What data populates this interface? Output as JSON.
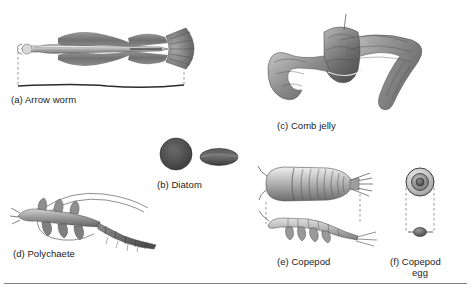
{
  "figure": {
    "background_color": "#ffffff",
    "ink_color": "#1b1b1b",
    "rule_color": "#7e7e7e",
    "dashed_guide_color": "#8d8d8d"
  },
  "specimens": [
    {
      "key": "arrow-worm",
      "letter": "(a)",
      "name": "Arrow worm",
      "caption": "(a) Arrow worm",
      "view": "lateral whole body",
      "has_scale_bracket": true,
      "shading": "grayscale stipple engraving"
    },
    {
      "key": "diatom",
      "letter": "(b)",
      "name": "Diatom",
      "caption": "(b) Diatom",
      "view": "valve face view and girdle side view",
      "has_scale_bracket": false,
      "shading": "dark gray stipple",
      "fill_color": "#4a4a4a"
    },
    {
      "key": "comb-jelly",
      "letter": "(c)",
      "name": "Comb jelly",
      "caption": "(c) Comb jelly",
      "view": "ribbon form, undulating",
      "has_scale_bracket": false,
      "shading": "gray gradient engraving"
    },
    {
      "key": "polychaete",
      "letter": "(d)",
      "name": "Polychaete",
      "caption": "(d) Polychaete",
      "view": "lateral, segmented with bristles",
      "has_scale_bracket": false,
      "shading": "gray engraving"
    },
    {
      "key": "copepod",
      "letter": "(e)",
      "name": "Copepod",
      "caption": "(e) Copepod",
      "view": "dorsal view above, lateral view below",
      "has_scale_bracket": true,
      "shading": "gray gradient engraving"
    },
    {
      "key": "copepod-egg",
      "letter": "(f)",
      "name": "Copepod egg",
      "caption_line1": "(f) Copepod",
      "caption_line2": "egg",
      "view": "enlarged circular egg above, actual size dot below",
      "has_scale_bracket": true,
      "shading": "concentric gray rings"
    }
  ]
}
